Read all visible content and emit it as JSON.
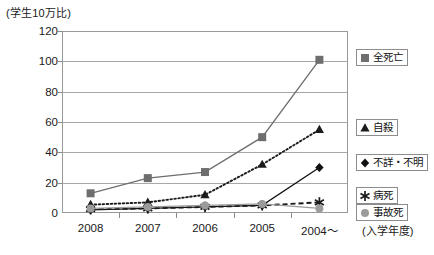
{
  "chart_data": {
    "type": "line",
    "title": "",
    "subtitle": "",
    "ylabel": "(学生10万比)",
    "xlabel": "(入学年度)",
    "categories": [
      "2008",
      "2007",
      "2006",
      "2005",
      "2004〜"
    ],
    "ylim": [
      0,
      120
    ],
    "ytick_values": [
      0,
      20,
      40,
      60,
      80,
      100,
      120
    ],
    "ytick_labels": [
      "0",
      "20",
      "40",
      "60",
      "80",
      "100",
      "120"
    ],
    "grid": true,
    "legend_position": "right",
    "series": [
      {
        "name": "全死亡",
        "marker": "square",
        "color": "#6e6e6e",
        "line_style": "solid",
        "values": [
          13,
          23,
          27,
          50,
          101
        ]
      },
      {
        "name": "自殺",
        "marker": "triangle",
        "color": "#1c1c1c",
        "line_style": "dotted",
        "values": [
          5.5,
          7,
          12,
          32,
          55
        ]
      },
      {
        "name": "不詳・不明",
        "marker": "diamond",
        "color": "#111111",
        "line_style": "solid",
        "values": [
          2,
          3,
          4,
          5,
          30
        ]
      },
      {
        "name": "病死",
        "marker": "asterisk",
        "color": "#1a1a1a",
        "line_style": "dashed",
        "values": [
          2.5,
          3,
          4,
          5,
          7
        ]
      },
      {
        "name": "事故死",
        "marker": "circle",
        "color": "#9b9b9b",
        "line_style": "solid",
        "values": [
          3,
          4,
          5,
          6,
          3
        ]
      }
    ]
  },
  "legend": {
    "items": [
      {
        "label": "全死亡"
      },
      {
        "label": "自殺"
      },
      {
        "label": "不詳・不明"
      },
      {
        "label": "病死"
      },
      {
        "label": "事故死"
      }
    ]
  }
}
